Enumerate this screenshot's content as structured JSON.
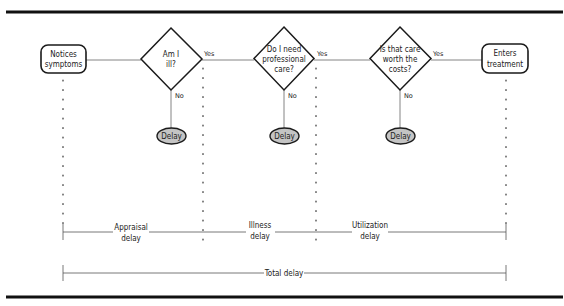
{
  "diagram": {
    "start_box": {
      "line1": "Notices",
      "line2": "symptoms"
    },
    "end_box": {
      "line1": "Enters",
      "line2": "treatment"
    },
    "decisions": [
      {
        "lines": [
          "Am I",
          "ill?"
        ],
        "yes": "Yes",
        "no": "No",
        "delay": "Delay"
      },
      {
        "lines": [
          "Do I need",
          "professional",
          "care?"
        ],
        "yes": "Yes",
        "no": "No",
        "delay": "Delay"
      },
      {
        "lines": [
          "Is that care",
          "worth the",
          "costs?"
        ],
        "yes": "Yes",
        "no": "No",
        "delay": "Delay"
      }
    ],
    "spans": [
      {
        "line1": "Appraisal",
        "line2": "delay"
      },
      {
        "line1": "Illness",
        "line2": "delay"
      },
      {
        "line1": "Utilization",
        "line2": "delay"
      }
    ],
    "total": {
      "label": "Total delay"
    },
    "colors": {
      "stroke": "#1a1a1a",
      "delay_fill": "#c4c4c4",
      "rule": "#111111",
      "thin": "#555555"
    }
  }
}
